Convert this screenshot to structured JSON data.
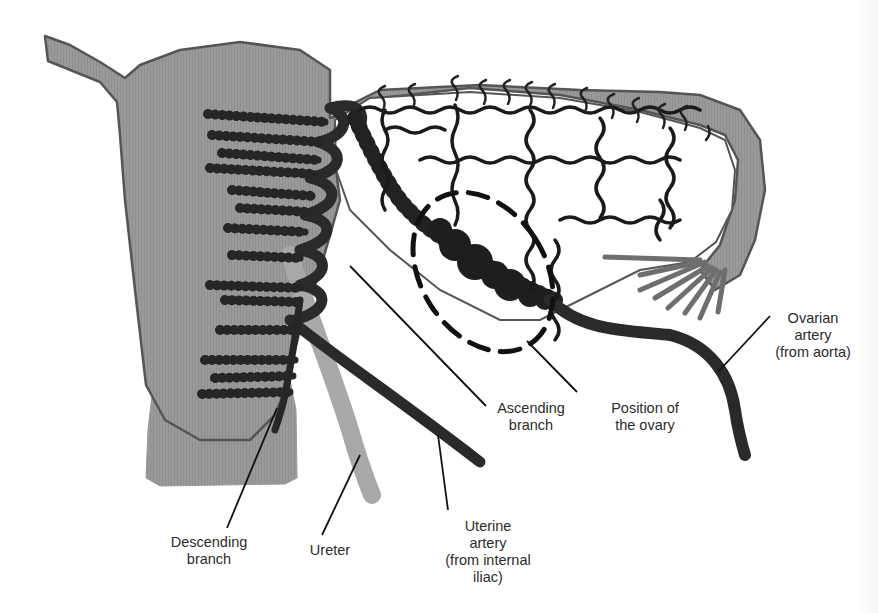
{
  "diagram": {
    "colors": {
      "uterus_fill": "#9a9a9a",
      "uterus_outline": "#555555",
      "artery": "#2a2a2a",
      "small_vessel": "#1e1e1e",
      "fimbriae": "#6e6e6e",
      "ureter": "#a8a8a8",
      "ovary_outline": "#111111",
      "leader_line": "#111111",
      "label_text": "#2c2c2c",
      "background": "#ffffff"
    },
    "labels": {
      "ovarian_artery": [
        "Ovarian",
        "artery",
        "(from aorta)"
      ],
      "ascending_branch": [
        "Ascending",
        "branch"
      ],
      "position_of_ovary": [
        "Position of",
        "the ovary"
      ],
      "descending_branch": [
        "Descending",
        "branch"
      ],
      "ureter": [
        "Ureter"
      ],
      "uterine_artery": [
        "Uterine",
        "artery",
        "(from internal",
        "iliac)"
      ]
    },
    "structures": [
      "uterus",
      "uterine tube",
      "fimbriae",
      "ovary (dashed outline)",
      "ureter",
      "uterine artery",
      "ascending branch",
      "descending branch",
      "ovarian artery",
      "anastomotic arcade"
    ]
  }
}
